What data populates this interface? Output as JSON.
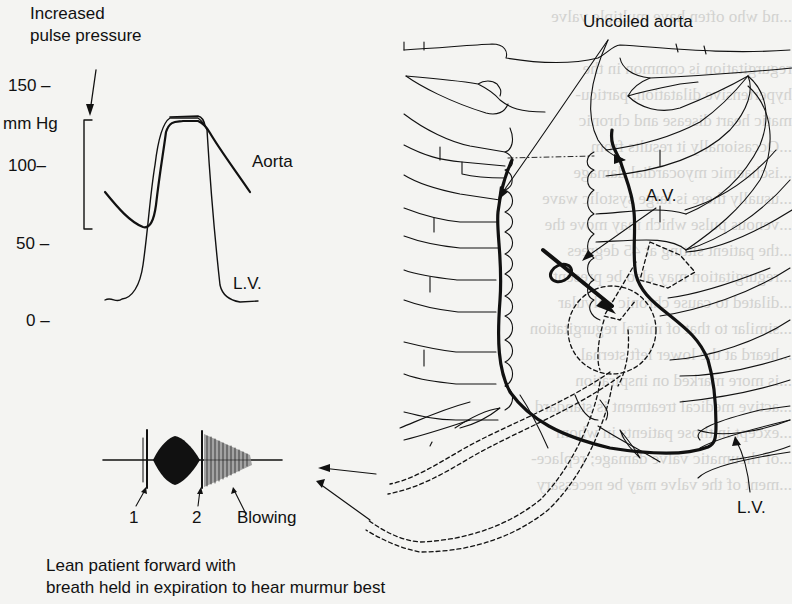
{
  "figure": {
    "pressure_trace": {
      "annotation_top": [
        "Increased",
        "pulse pressure"
      ],
      "y_axis_unit": "mm Hg",
      "y_ticks": [
        "150",
        "100",
        "50",
        "0"
      ],
      "trace_labels": {
        "aorta": "Aorta",
        "lv": "L.V."
      }
    },
    "phonocardiogram": {
      "labels": {
        "s1": "1",
        "s2": "2",
        "murmur": "Blowing"
      },
      "caption": [
        "Lean patient forward with",
        "breath held in expiration to hear murmur best"
      ]
    },
    "chest_diagram": {
      "labels": {
        "uncoiled_aorta": "Uncoiled aorta",
        "av": "A.V.",
        "lv": "L.V."
      }
    },
    "bleed_through_text": {
      "left_col": "murmur is decrescendo and be\nstole at the left sternal edge\nmurmur). The distinction from\nration can generally be made from",
      "right_col": "...nd who often have multiple valve\n\nregurgitation is common in the\nhypertensive dilatation, particu-\nmatic heart disease and chronic\n...Occasionally it results from\n...ischaemic myocardial damage\n...usually there is large systolic wave\n...venous pulse which may move the\n...the patient sitting at 45 degrees\n...regurgitation may also be present\n...dilated to cause chronic valvular\n...similar to that of mitral regurgitation\n...heard at the lower left sternal\n...is more marked on inspiration\n...active medical treatment is standard\n...except in those patients in whom\n...of rheumatic valve damage; replace-\n...ment of the valve may be necessary",
      "heading": "INFECTIVE ENDOCARDITIS"
    }
  }
}
